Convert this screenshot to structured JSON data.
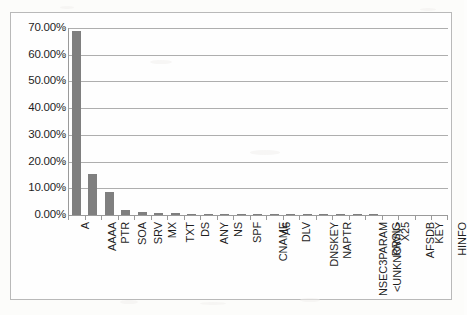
{
  "chart_data": {
    "type": "bar",
    "title": "",
    "subtitle": "",
    "xlabel": "",
    "ylabel": "",
    "ylim": [
      0,
      70
    ],
    "grid": true,
    "legend": false,
    "legend_position": "none",
    "value_suffix": "%",
    "bar_color": "#7f7f7f",
    "axis_color": "#9a9a9a",
    "gridline_color": "#aeaeae",
    "frame_color": "#b9b9b9",
    "ytick_labels": [
      "70.00%",
      "60.00%",
      "50.00%",
      "40.00%",
      "30.00%",
      "20.00%",
      "10.00%",
      "0.00%"
    ],
    "ytick_values": [
      70,
      60,
      50,
      40,
      30,
      20,
      10,
      0
    ],
    "categories": [
      "A",
      "AAAA",
      "PTR",
      "SOA",
      "SRV",
      "MX",
      "TXT",
      "DS",
      "ANY",
      "NS",
      "SPF",
      "CNAME",
      "A6",
      "DLV",
      "DNSKEY",
      "NAPTR",
      "NSEC3PARAM",
      "<UNKNOWN>",
      "RRSIG",
      "X25",
      "AFSDB",
      "KEY",
      "HINFO"
    ],
    "values": [
      69.0,
      15.3,
      8.8,
      2.0,
      1.1,
      0.9,
      0.6,
      0.2,
      0.15,
      0.05,
      0.04,
      0.03,
      0.02,
      0.02,
      0.02,
      0.01,
      0.01,
      0.01,
      0.01,
      0.0,
      0.0,
      0.0,
      0.0
    ]
  }
}
